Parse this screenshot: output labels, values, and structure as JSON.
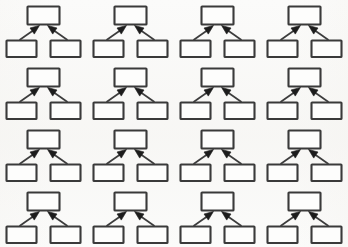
{
  "canvas": {
    "width": 348,
    "height": 247,
    "background_color": "#fbfbfa"
  },
  "figure": {
    "type": "diagram-grid",
    "layout": "4x4",
    "rows": 4,
    "columns": 4,
    "unit_count": 16
  },
  "style": {
    "box_stroke_color": "#3a3a3a",
    "box_fill_color": "#fdfdfc",
    "arrow_line_color": "#3c3c3c",
    "arrow_head_color": "#1c1c1c"
  },
  "unit": {
    "name": "convergence-diagram",
    "nodes": [
      {
        "id": "top",
        "role": "parent",
        "label": ""
      },
      {
        "id": "bottom-left",
        "role": "child",
        "label": ""
      },
      {
        "id": "bottom-right",
        "role": "child",
        "label": ""
      }
    ],
    "edges": [
      {
        "from": "bottom-left",
        "to": "top",
        "direction": "up-right",
        "arrowhead": "filled-triangle"
      },
      {
        "from": "bottom-right",
        "to": "top",
        "direction": "up-left",
        "arrowhead": "filled-triangle"
      }
    ]
  },
  "units": [
    {
      "index": 1,
      "row": 1,
      "column": 1
    },
    {
      "index": 2,
      "row": 1,
      "column": 2
    },
    {
      "index": 3,
      "row": 1,
      "column": 3
    },
    {
      "index": 4,
      "row": 1,
      "column": 4
    },
    {
      "index": 5,
      "row": 2,
      "column": 1
    },
    {
      "index": 6,
      "row": 2,
      "column": 2
    },
    {
      "index": 7,
      "row": 2,
      "column": 3
    },
    {
      "index": 8,
      "row": 2,
      "column": 4
    },
    {
      "index": 9,
      "row": 3,
      "column": 1
    },
    {
      "index": 10,
      "row": 3,
      "column": 2
    },
    {
      "index": 11,
      "row": 3,
      "column": 3
    },
    {
      "index": 12,
      "row": 3,
      "column": 4
    },
    {
      "index": 13,
      "row": 4,
      "column": 1
    },
    {
      "index": 14,
      "row": 4,
      "column": 2
    },
    {
      "index": 15,
      "row": 4,
      "column": 3
    },
    {
      "index": 16,
      "row": 4,
      "column": 4
    }
  ]
}
